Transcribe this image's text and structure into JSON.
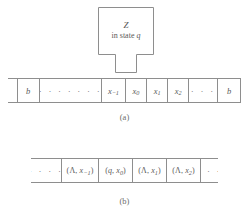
{
  "figure": {
    "machine": {
      "name": "Z",
      "state_prefix": "in state ",
      "state_symbol": "q",
      "shape": "box-with-read-head-notch"
    },
    "panel_a": {
      "caption": "(a)",
      "tape_cells": [
        {
          "kind": "edge",
          "text": ""
        },
        {
          "kind": "symbol",
          "text": "b"
        },
        {
          "kind": "dots",
          "text": "· · · · · · ·"
        },
        {
          "kind": "symbol",
          "base": "x",
          "sub": "−1"
        },
        {
          "kind": "symbol",
          "base": "x",
          "sub": "0"
        },
        {
          "kind": "symbol",
          "base": "x",
          "sub": "1"
        },
        {
          "kind": "symbol",
          "base": "x",
          "sub": "2"
        },
        {
          "kind": "dots",
          "text": "· · ·"
        },
        {
          "kind": "symbol",
          "text": "b"
        },
        {
          "kind": "edge",
          "text": ""
        }
      ]
    },
    "panel_b": {
      "caption": "(b)",
      "tape_cells": [
        {
          "kind": "dots",
          "text": "· · · ·"
        },
        {
          "kind": "pair",
          "left": "Λ",
          "base": "x",
          "sub": "−1"
        },
        {
          "kind": "pair",
          "left": "q",
          "base": "x",
          "sub": "0"
        },
        {
          "kind": "pair",
          "left": "Λ",
          "base": "x",
          "sub": "1"
        },
        {
          "kind": "pair",
          "left": "Λ",
          "base": "x",
          "sub": "2"
        },
        {
          "kind": "dots",
          "text": "· · ·"
        }
      ]
    },
    "colors": {
      "line": "#8e8e8e",
      "text": "#5a5a5a",
      "background": "#ffffff"
    }
  }
}
